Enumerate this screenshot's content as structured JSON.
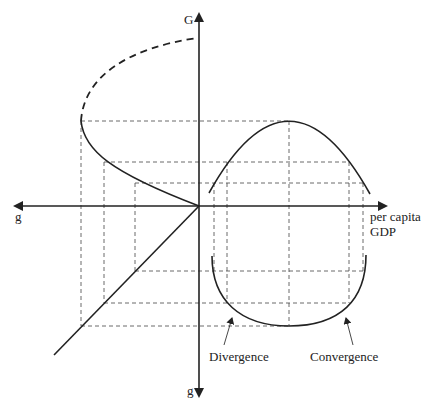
{
  "diagram": {
    "type": "four-quadrant growth / per capita GDP diagram",
    "axes": {
      "up_label": "G",
      "left_label": "g",
      "down_label": "g",
      "right_label_line1": "per capita",
      "right_label_line2": "GDP"
    },
    "annotations": {
      "divergence": "Divergence",
      "convergence": "Convergence"
    },
    "elements": [
      "inverted-U curve of G vs per capita GDP (upper-right quadrant)",
      "U curve of g vs per capita GDP (lower-right quadrant)",
      "sideways parabola mapping G to g (upper-left quadrant), upper branch dashed",
      "45-degree line mapping g to g (lower-left quadrant)",
      "dashed projection lines connecting quadrants"
    ],
    "colors": {
      "line": "#222222",
      "background": "#ffffff"
    }
  }
}
